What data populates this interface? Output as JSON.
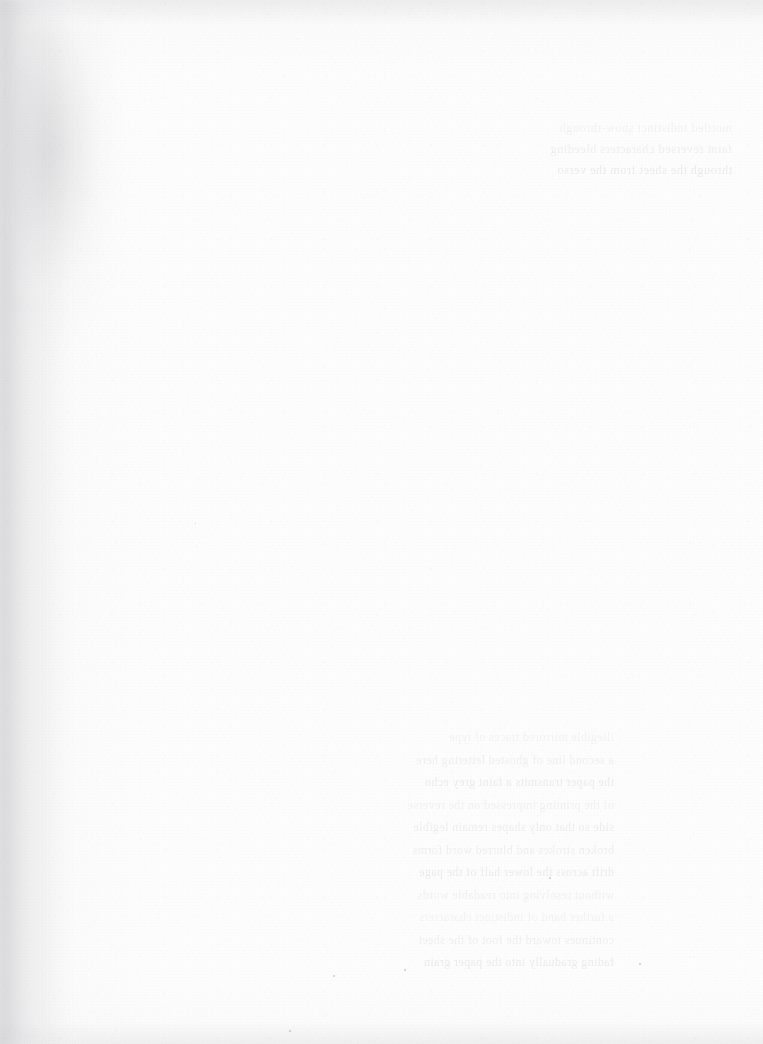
{
  "page": {
    "kind": "scanned-blank-page",
    "width": 763,
    "height": 1044,
    "paper_color": "#fdfdfd",
    "grain_color": "#f2f2f3",
    "gutter_shadow_color": "#d9d9dd",
    "ghost_text_color": "#6c6c74",
    "edge_shade_color": "#e6e6e9"
  },
  "artifacts": {
    "gutter_shadow": {
      "name": "binding-gutter-shadow",
      "x": 10,
      "y": 24,
      "width": 118,
      "height": 368
    },
    "gutter_streak": {
      "name": "gutter-edge-streak",
      "x": 0,
      "y": 0,
      "width": 70,
      "height": 1044
    },
    "specks": [
      {
        "x": 549,
        "y": 877,
        "size": 2
      },
      {
        "x": 404,
        "y": 969,
        "size": 2
      },
      {
        "x": 333,
        "y": 975,
        "size": 2
      },
      {
        "x": 639,
        "y": 963,
        "size": 2
      },
      {
        "x": 289,
        "y": 1030,
        "size": 2
      },
      {
        "x": 195,
        "y": 523,
        "size": 1
      }
    ]
  },
  "ghost_text": {
    "top_right": {
      "name": "show-through-text-top-right",
      "x": 440,
      "y": 118,
      "width": 292,
      "lines": [
        "mottled indistinct show-through",
        "faint reversed characters bleeding",
        "through the sheet from the verso"
      ]
    },
    "lower_center": {
      "name": "show-through-text-lower-center",
      "x": 190,
      "y": 726,
      "width": 424,
      "lines": [
        "illegible mirrored traces of type",
        "a second line of ghosted lettering here",
        "the paper transmits a faint grey echo",
        "of the printing impressed on the reverse",
        "side so that only shapes remain legible",
        "",
        "broken strokes and blurred word forms",
        "drift across the lower half of the page",
        "without resolving into readable words",
        "",
        "a further band of indistinct characters",
        "continues toward the foot of the sheet",
        "fading gradually into the paper grain"
      ]
    }
  }
}
